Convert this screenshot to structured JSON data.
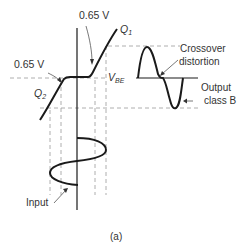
{
  "figure": {
    "caption": "(a)",
    "labels": {
      "vbe_top": "0.65 V",
      "vbe_left": "0.65 V",
      "q1": "Q",
      "q1_sub": "1",
      "q2": "Q",
      "q2_sub": "2",
      "vbe": "V",
      "vbe_sub": "BE",
      "crossover_line1": "Crossover",
      "crossover_line2": "distortion",
      "output_line1": "Output",
      "output_line2": "class B",
      "input": "Input"
    },
    "colors": {
      "curve": "#1a1a1a",
      "dashed": "#999999",
      "text": "#333333"
    }
  }
}
